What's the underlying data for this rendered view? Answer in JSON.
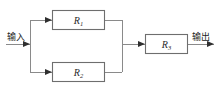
{
  "diagram": {
    "input_label": "输入",
    "output_label": "输出",
    "blocks": [
      {
        "name": "block-r1",
        "symbol": "R",
        "subscript": "1"
      },
      {
        "name": "block-r2",
        "symbol": "R",
        "subscript": "2"
      },
      {
        "name": "block-r3",
        "symbol": "R",
        "subscript": "3"
      }
    ],
    "colors": {
      "background": "#ffffff",
      "box_border": "#6e6e6e",
      "box_fill": "#ffffff",
      "wire": "#8a8a8a",
      "arrow": "#2f2f2f",
      "label_text": "#2b2b2b",
      "io_text": "#1c1c1c"
    }
  }
}
